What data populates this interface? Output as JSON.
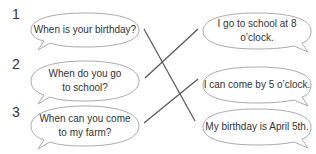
{
  "questions": [
    {
      "number": "1",
      "text": "When is your birthday?"
    },
    {
      "number": "2",
      "text": "When do you go to school?"
    },
    {
      "number": "3",
      "text": "When can you come to my farm?"
    }
  ],
  "answers": [
    {
      "text": "I go to school at 8 o’clock."
    },
    {
      "text": "I can come by 5 o’clock."
    },
    {
      "text": "My birthday is April 5th."
    }
  ],
  "matches": [
    {
      "question": "1",
      "answer": 3
    },
    {
      "question": "2",
      "answer": 1
    },
    {
      "question": "3",
      "answer": 2
    }
  ],
  "colors": {
    "text": "#333333",
    "line": "#555555",
    "bubble_stroke": "#aaaaaa"
  }
}
